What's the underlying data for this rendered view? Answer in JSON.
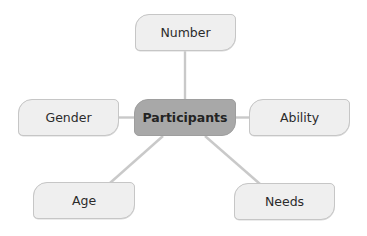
{
  "diagram": {
    "type": "mind-map",
    "center": {
      "label": "Participants",
      "color": "#a8a8a8"
    },
    "branches": [
      {
        "label": "Number"
      },
      {
        "label": "Gender"
      },
      {
        "label": "Ability"
      },
      {
        "label": "Age"
      },
      {
        "label": "Needs"
      }
    ],
    "colors": {
      "leaf_fill": "#efefef",
      "leaf_border": "#c6c6c6",
      "connector": "#c9c9c9",
      "text": "#2b2b2b"
    }
  }
}
